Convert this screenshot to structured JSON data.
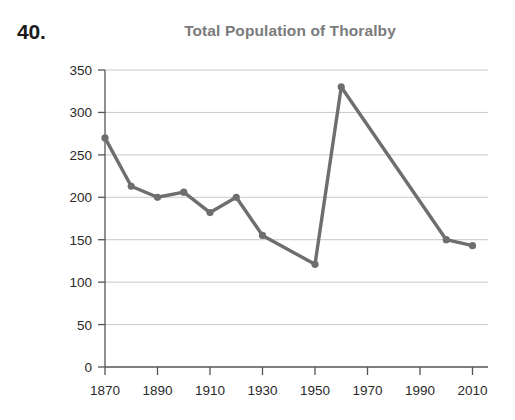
{
  "question_number": "40.",
  "chart_data": {
    "type": "line",
    "title": "Total Population of Thoralby",
    "xlabel": "",
    "ylabel": "",
    "x": [
      1870,
      1880,
      1890,
      1900,
      1910,
      1920,
      1930,
      1950,
      1960,
      2000,
      2010
    ],
    "values": [
      270,
      213,
      200,
      206,
      182,
      200,
      155,
      121,
      330,
      150,
      143
    ],
    "series": [
      {
        "name": "Total Population of Thoralby",
        "values": [
          270,
          213,
          200,
          206,
          182,
          200,
          155,
          121,
          330,
          150,
          143
        ]
      }
    ],
    "xlim": [
      1865,
      2015
    ],
    "ylim": [
      0,
      350
    ],
    "xticks": [
      1870,
      1890,
      1910,
      1930,
      1950,
      1970,
      1990,
      2010
    ],
    "xtick_labels": [
      "1870",
      "1890",
      "1910",
      "1930",
      "1950",
      "1970",
      "1990",
      "2010"
    ],
    "yticks": [
      0,
      50,
      100,
      150,
      200,
      250,
      300,
      350
    ],
    "ytick_labels": [
      "0",
      "50",
      "100",
      "150",
      "200",
      "250",
      "300",
      "350"
    ],
    "grid": "horizontal",
    "legend": "none",
    "line_color": "#6e6e6e",
    "grid_color": "#c8c8c8",
    "axis_color": "#555555",
    "title_color": "#7b7b7b"
  }
}
